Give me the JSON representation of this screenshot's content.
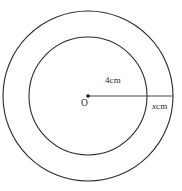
{
  "figure": {
    "background_color": "#ffffff",
    "stroke_color": "#2a2a2a",
    "line_color": "#4a4a4a",
    "text_color": "#2b2b2b",
    "center": {
      "label": "O",
      "x": 88,
      "y": 96
    },
    "circles": [
      {
        "name": "inner-circle",
        "radius_px": 59,
        "radius_label": "4cm",
        "radius_value": 4,
        "radius_unit": "cm"
      },
      {
        "name": "outer-circle",
        "radius_px": 85,
        "band_label_variable": "x",
        "band_label_unit": "cm",
        "band_label_full": "x cm"
      }
    ],
    "radius_line": {
      "name": "radius-line",
      "from_x": 88,
      "from_y": 96,
      "to_x": 173,
      "to_y": 96
    },
    "labels": {
      "inner_radius": "4cm",
      "outer_band_variable": "x",
      "outer_band_unit": "cm",
      "center_point": "O"
    }
  }
}
